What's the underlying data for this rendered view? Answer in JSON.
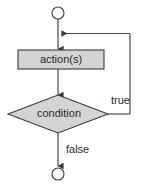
{
  "diagram": {
    "canvas": {
      "width": 142,
      "height": 185,
      "background": "#ffffff"
    },
    "colors": {
      "shape_fill": "#d4d4d4",
      "shape_stroke": "#3a3a3a",
      "line_stroke": "#4a4a4a",
      "text": "#2b2b2b",
      "background": "#ffffff"
    },
    "nodes": {
      "start": {
        "type": "terminator-circle",
        "label": "",
        "cx": 58,
        "cy": 13,
        "r": 6
      },
      "action": {
        "type": "process-rectangle",
        "label": "action(s)",
        "x": 18,
        "y": 50,
        "width": 86,
        "height": 19
      },
      "condition": {
        "type": "decision-diamond",
        "label": "condition",
        "cx": 58,
        "cy": 114,
        "rx": 50,
        "ry": 19
      },
      "end": {
        "type": "terminator-circle",
        "label": "",
        "cx": 58,
        "cy": 174,
        "r": 6
      }
    },
    "edges": {
      "start_to_action": {
        "label": ""
      },
      "action_to_condition": {
        "label": ""
      },
      "condition_true": {
        "label": "true",
        "label_x": 112,
        "label_y": 101
      },
      "condition_false": {
        "label": "false",
        "label_x": 67,
        "label_y": 150
      }
    }
  }
}
